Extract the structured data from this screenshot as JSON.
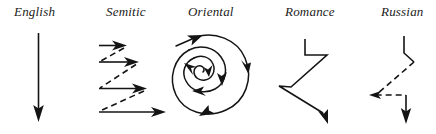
{
  "figure": {
    "title_visible": false,
    "background_color": "#ffffff",
    "ink_color": "#141414",
    "width": 436,
    "height": 134
  },
  "panels": [
    {
      "id": "english",
      "label": "English",
      "pattern": "straight-vertical-arrow",
      "line_style": "solid",
      "direction": "downward"
    },
    {
      "id": "semitic",
      "label": "Semitic",
      "pattern": "parallel-rightward-arrows-with-dashed-returns",
      "line_style": "solid-and-dashed",
      "arrow_count": 4,
      "direction": "rightward"
    },
    {
      "id": "oriental",
      "label": "Oriental",
      "pattern": "inward-clockwise-spiral",
      "line_style": "solid",
      "direction": "spiral-inward"
    },
    {
      "id": "romance",
      "label": "Romance",
      "pattern": "zigzag-digression",
      "line_style": "solid",
      "direction": "downward"
    },
    {
      "id": "russian",
      "label": "Russian",
      "pattern": "zigzag-with-dashed-digression",
      "line_style": "solid-and-dashed",
      "direction": "downward"
    }
  ]
}
